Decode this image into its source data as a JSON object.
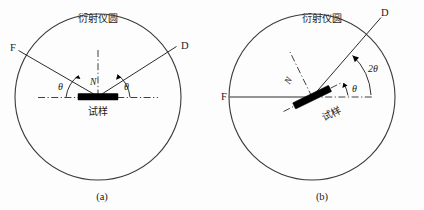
{
  "figure": {
    "background_color": "#fdfdfd",
    "line_color": "#2b2b2b",
    "sample_color": "#000000",
    "width": 424,
    "height": 210
  },
  "panels": [
    {
      "id": "a",
      "caption": "(a)",
      "circle_label": "衍射仪圆",
      "sample_label": "试样",
      "normal_label": "N",
      "source_label": "F",
      "detector_label": "D",
      "angles": [
        {
          "name": "theta-left",
          "text": "θ"
        },
        {
          "name": "theta-right",
          "text": "θ"
        }
      ],
      "geometry": {
        "center_x": 98,
        "center_y": 97,
        "radius": 83,
        "source_x": 18,
        "source_y": 50,
        "detector_x": 177,
        "detector_y": 46,
        "sample_tilt_deg": 0
      }
    },
    {
      "id": "b",
      "caption": "(b)",
      "circle_label": "衍射仪圆",
      "sample_label": "试样",
      "normal_label": "N",
      "source_label": "F",
      "detector_label": "D",
      "angles": [
        {
          "name": "theta",
          "text": "θ"
        },
        {
          "name": "two-theta",
          "text": "2θ"
        }
      ],
      "geometry": {
        "center_x": 312,
        "center_y": 97,
        "radius": 83,
        "source_x": 229,
        "source_y": 97,
        "detector_x": 381,
        "detector_y": 17,
        "sample_tilt_deg": 26
      }
    }
  ]
}
